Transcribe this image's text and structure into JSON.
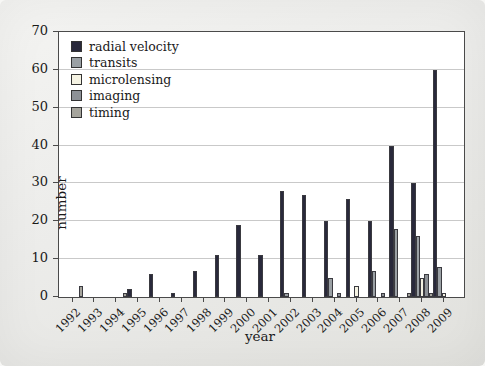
{
  "chart_data": {
    "type": "bar",
    "title": "",
    "xlabel": "year",
    "ylabel": "number",
    "ylim": [
      0,
      70
    ],
    "yticks": [
      0,
      10,
      20,
      30,
      40,
      50,
      60,
      70
    ],
    "grid": "horizontal",
    "legend_position": "upper-left",
    "categories": [
      "1992",
      "1993",
      "1994",
      "1995",
      "1996",
      "1997",
      "1998",
      "1999",
      "2000",
      "2001",
      "2002",
      "2003",
      "2004",
      "2005",
      "2006",
      "2007",
      "2008",
      "2009"
    ],
    "series": [
      {
        "name": "radial velocity",
        "color": "#29293b",
        "values": [
          0,
          0,
          0,
          2,
          6,
          1,
          7,
          11,
          19,
          11,
          28,
          27,
          20,
          26,
          20,
          40,
          30,
          60
        ]
      },
      {
        "name": "transits",
        "color": "#9aa0a4",
        "values": [
          0,
          0,
          0,
          0,
          0,
          0,
          0,
          0,
          0,
          0,
          1,
          0,
          5,
          0,
          7,
          18,
          16,
          8
        ]
      },
      {
        "name": "microlensing",
        "color": "#f5f3e3",
        "values": [
          0,
          0,
          0,
          0,
          0,
          0,
          0,
          0,
          0,
          0,
          0,
          0,
          0,
          3,
          0,
          0,
          5,
          1
        ]
      },
      {
        "name": "imaging",
        "color": "#8d9196",
        "values": [
          0,
          0,
          0,
          0,
          0,
          0,
          0,
          0,
          0,
          0,
          0,
          0,
          1,
          0,
          1,
          0,
          6,
          0
        ]
      },
      {
        "name": "timing",
        "color": "#a5a49c",
        "values": [
          3,
          0,
          1,
          0,
          0,
          0,
          0,
          0,
          0,
          0,
          0,
          0,
          0,
          0,
          0,
          1,
          1,
          0
        ]
      }
    ],
    "colors": {
      "bar_outline": "#3a3a40",
      "gridline": "#c9c9c9",
      "frame": "#4a4a4a",
      "plot_bg": "#ffffff",
      "page_bg": "#ebebe9",
      "text": "#1a1a1a"
    }
  }
}
